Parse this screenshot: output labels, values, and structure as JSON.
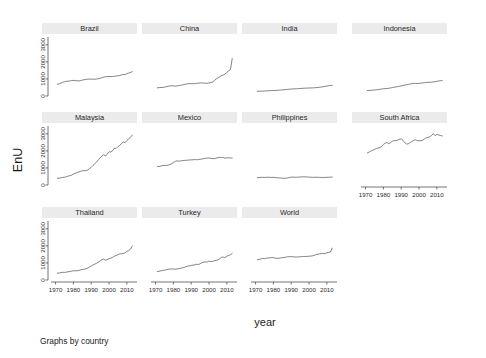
{
  "figure": {
    "ylabel": "EnU",
    "xlabel": "year",
    "note": "Graphs by country",
    "series_color": "#5a5a5a",
    "strip_color": "#ebebeb",
    "background": "#ffffff"
  },
  "axes": {
    "x_ticks": [
      "1970",
      "1980",
      "1990",
      "2000",
      "2010"
    ],
    "x_tick_values": [
      1970,
      1980,
      1990,
      2000,
      2010
    ],
    "y_ticks": [
      "0",
      "1000",
      "2000",
      "3000"
    ],
    "y_tick_values": [
      0,
      1000,
      2000,
      3000
    ],
    "xlim": [
      1968,
      2014
    ],
    "ylim": [
      0,
      3400
    ],
    "grid": false
  },
  "chart_data": {
    "type": "line",
    "title": "",
    "xlabel": "year",
    "ylabel": "EnU",
    "xlim": [
      1968,
      2014
    ],
    "ylim": [
      0,
      3400
    ],
    "grid": false,
    "legend": "none",
    "layout": {
      "rows": 3,
      "cols": 4,
      "panels_total": 11,
      "empty_cells": 1
    },
    "x": [
      1971,
      1972,
      1973,
      1974,
      1975,
      1976,
      1977,
      1978,
      1979,
      1980,
      1981,
      1982,
      1983,
      1984,
      1985,
      1986,
      1987,
      1988,
      1989,
      1990,
      1991,
      1992,
      1993,
      1994,
      1995,
      1996,
      1997,
      1998,
      1999,
      2000,
      2001,
      2002,
      2003,
      2004,
      2005,
      2006,
      2007,
      2008,
      2009,
      2010,
      2011,
      2012,
      2013
    ],
    "panels": [
      {
        "label": "Brazil",
        "row": 1,
        "col": 1,
        "values": [
          690,
          710,
          760,
          800,
          830,
          860,
          870,
          880,
          905,
          915,
          900,
          895,
          880,
          905,
          930,
          955,
          975,
          985,
          995,
          985,
          990,
          985,
          995,
          1015,
          1035,
          1070,
          1105,
          1130,
          1140,
          1145,
          1135,
          1145,
          1150,
          1175,
          1185,
          1200,
          1235,
          1265,
          1250,
          1315,
          1345,
          1380,
          1430
        ]
      },
      {
        "label": "China",
        "row": 1,
        "col": 2,
        "values": [
          480,
          490,
          500,
          500,
          520,
          545,
          565,
          595,
          600,
          595,
          580,
          590,
          610,
          630,
          650,
          670,
          695,
          715,
          725,
          730,
          720,
          725,
          745,
          755,
          760,
          765,
          760,
          745,
          745,
          760,
          790,
          820,
          905,
          1000,
          1060,
          1125,
          1190,
          1230,
          1285,
          1390,
          1480,
          1540,
          2200
        ]
      },
      {
        "label": "India",
        "row": 1,
        "col": 3,
        "values": [
          275,
          280,
          285,
          285,
          290,
          300,
          305,
          310,
          320,
          320,
          325,
          330,
          340,
          350,
          360,
          370,
          380,
          390,
          400,
          410,
          415,
          420,
          425,
          430,
          440,
          445,
          455,
          460,
          465,
          470,
          470,
          475,
          480,
          490,
          500,
          515,
          530,
          545,
          565,
          585,
          600,
          615,
          625
        ]
      },
      {
        "label": "Indonesia",
        "row": 1,
        "col": 4,
        "values": [
          320,
          325,
          330,
          345,
          355,
          365,
          375,
          390,
          410,
          425,
          430,
          440,
          455,
          470,
          490,
          510,
          530,
          550,
          570,
          590,
          615,
          640,
          660,
          680,
          700,
          725,
          745,
          735,
          730,
          740,
          755,
          770,
          780,
          795,
          800,
          805,
          810,
          825,
          840,
          860,
          880,
          895,
          910
        ]
      },
      {
        "label": "Malaysia",
        "row": 2,
        "col": 1,
        "values": [
          390,
          400,
          420,
          440,
          455,
          490,
          520,
          545,
          580,
          640,
          690,
          730,
          760,
          800,
          830,
          840,
          845,
          880,
          960,
          1040,
          1150,
          1240,
          1340,
          1480,
          1600,
          1690,
          1780,
          1700,
          1820,
          1950,
          1930,
          2010,
          2160,
          2140,
          2250,
          2320,
          2440,
          2520,
          2480,
          2610,
          2700,
          2790,
          2930
        ]
      },
      {
        "label": "Mexico",
        "row": 2,
        "col": 2,
        "values": [
          1090,
          1080,
          1110,
          1140,
          1150,
          1145,
          1165,
          1200,
          1250,
          1310,
          1380,
          1420,
          1390,
          1410,
          1430,
          1440,
          1450,
          1450,
          1470,
          1470,
          1480,
          1490,
          1480,
          1490,
          1510,
          1520,
          1545,
          1565,
          1575,
          1585,
          1560,
          1545,
          1545,
          1570,
          1600,
          1620,
          1615,
          1610,
          1570,
          1590,
          1595,
          1585,
          1580
        ]
      },
      {
        "label": "Philippines",
        "row": 2,
        "col": 3,
        "values": [
          430,
          435,
          445,
          450,
          440,
          450,
          455,
          450,
          445,
          450,
          435,
          425,
          415,
          410,
          400,
          395,
          400,
          415,
          440,
          460,
          465,
          455,
          455,
          460,
          470,
          475,
          485,
          475,
          470,
          465,
          455,
          450,
          450,
          455,
          450,
          445,
          445,
          445,
          440,
          450,
          455,
          460,
          465
        ]
      },
      {
        "label": "South Africa",
        "row": 2,
        "col": 4,
        "values": [
          1880,
          1930,
          1990,
          2040,
          2080,
          2140,
          2160,
          2200,
          2250,
          2380,
          2450,
          2500,
          2420,
          2480,
          2570,
          2600,
          2600,
          2640,
          2680,
          2700,
          2620,
          2480,
          2400,
          2420,
          2480,
          2560,
          2620,
          2650,
          2600,
          2590,
          2600,
          2610,
          2700,
          2760,
          2790,
          2830,
          2900,
          3010,
          2890,
          2970,
          2930,
          2900,
          2880
        ]
      },
      {
        "label": "Thailand",
        "row": 3,
        "col": 1,
        "values": [
          400,
          410,
          430,
          450,
          445,
          460,
          480,
          500,
          520,
          540,
          540,
          545,
          560,
          590,
          615,
          630,
          655,
          700,
          760,
          820,
          880,
          930,
          980,
          1040,
          1120,
          1190,
          1230,
          1160,
          1200,
          1250,
          1280,
          1330,
          1400,
          1440,
          1480,
          1530,
          1540,
          1560,
          1590,
          1680,
          1720,
          1800,
          1990
        ]
      },
      {
        "label": "Turkey",
        "row": 3,
        "col": 2,
        "values": [
          500,
          510,
          540,
          560,
          570,
          600,
          620,
          640,
          650,
          640,
          635,
          645,
          665,
          690,
          715,
          730,
          780,
          810,
          830,
          850,
          870,
          890,
          920,
          910,
          950,
          1010,
          1050,
          1060,
          1050,
          1110,
          1080,
          1090,
          1130,
          1150,
          1180,
          1250,
          1330,
          1340,
          1320,
          1400,
          1440,
          1480,
          1560
        ]
      },
      {
        "label": "World",
        "row": 3,
        "col": 3,
        "values": [
          1190,
          1210,
          1230,
          1270,
          1250,
          1280,
          1290,
          1300,
          1320,
          1310,
          1280,
          1270,
          1270,
          1290,
          1310,
          1320,
          1340,
          1360,
          1370,
          1370,
          1360,
          1350,
          1350,
          1350,
          1360,
          1380,
          1380,
          1380,
          1380,
          1400,
          1400,
          1420,
          1450,
          1490,
          1510,
          1530,
          1550,
          1560,
          1540,
          1600,
          1620,
          1640,
          1870
        ]
      }
    ]
  }
}
